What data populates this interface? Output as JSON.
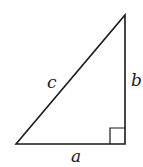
{
  "diagram": {
    "type": "right-triangle",
    "labels": {
      "hypotenuse": "c",
      "vertical_leg": "b",
      "horizontal_leg": "a"
    },
    "right_angle_marker": true,
    "stroke_color": "#1a1a1a",
    "background": "#ffffff"
  }
}
